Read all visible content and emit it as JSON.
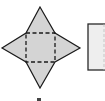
{
  "figure": {
    "type": "net-diagram",
    "shapes": [
      {
        "name": "square-pyramid-net",
        "base": "square",
        "faces": 4,
        "face_shape": "triangle",
        "fill": "#d4d4d4",
        "stroke": "#1a1a1a",
        "fold_lines": "dashed"
      },
      {
        "name": "rectangle-net-partial",
        "fill": "#eeeeee",
        "stroke": "#2a2a2a",
        "clipped": true
      }
    ],
    "label": ""
  },
  "colors": {
    "background": "#ffffff",
    "shape_fill": "#d4d4d4",
    "rect_fill": "#eeeeee",
    "stroke": "#1a1a1a"
  }
}
